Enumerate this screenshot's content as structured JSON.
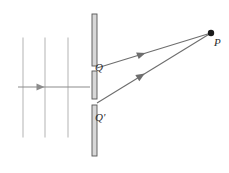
{
  "figure": {
    "width": 229,
    "height": 173,
    "background_color": "#ffffff"
  },
  "labels": {
    "slit_upper": "Q",
    "slit_lower": "Q'",
    "observation_point": "P"
  },
  "colors": {
    "wavefront": "#c9c9c9",
    "incident_ray": "#8c8c8c",
    "barrier_outline": "#555555",
    "barrier_fill": "#d8d8d8",
    "diffracted_ray": "#6e6e6e",
    "point_marker": "#1a1a1a",
    "label_text": "#2b2b2b"
  },
  "geometry": {
    "wavefronts": [
      {
        "name": "wavefront-1",
        "x": 23,
        "y1": 38,
        "y2": 137
      },
      {
        "name": "wavefront-2",
        "x": 45,
        "y1": 38,
        "y2": 137
      },
      {
        "name": "wavefront-3",
        "x": 68,
        "y1": 38,
        "y2": 137
      }
    ],
    "incident_ray": {
      "x1": 18,
      "y1": 87,
      "x2": 90,
      "y2": 87,
      "arrow_x": 42
    },
    "barrier": {
      "x": 92,
      "width": 5,
      "segments": [
        {
          "name": "barrier-segment-top",
          "y1": 14,
          "y2": 66
        },
        {
          "name": "barrier-segment-middle",
          "y1": 71,
          "y2": 99
        },
        {
          "name": "barrier-segment-bottom",
          "y1": 105,
          "y2": 156
        }
      ],
      "slits": [
        {
          "name": "slit-Q",
          "y": 68.5
        },
        {
          "name": "slit-Q-prime",
          "y": 102
        }
      ]
    },
    "diffracted_rays": [
      {
        "name": "ray-Q-to-P",
        "x1": 97,
        "y1": 68,
        "x2": 211,
        "y2": 33,
        "arrow_t": 0.5
      },
      {
        "name": "ray-Qprime-to-P",
        "x1": 97,
        "y1": 103,
        "x2": 211,
        "y2": 33,
        "arrow_t": 0.5
      }
    ],
    "point_P": {
      "x": 211,
      "y": 33,
      "radius": 3.2
    }
  }
}
